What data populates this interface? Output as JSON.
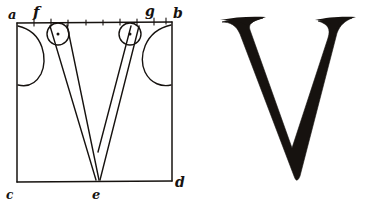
{
  "plate": {
    "title": "Geometric construction of the capital letter V",
    "ink_color": "#16120f",
    "paper_color": "#ffffff"
  },
  "construction": {
    "caption": "Square frame with construction arcs for the letter V",
    "frame": {
      "name": "bounding-square",
      "corner_labels": {
        "top_left": "a",
        "top_right": "b",
        "bottom_left": "c",
        "bottom_right": "d"
      }
    },
    "points": [
      {
        "id": "a",
        "label": "a",
        "role": "top-left-corner"
      },
      {
        "id": "f",
        "label": "f",
        "role": "top-left-stem-start"
      },
      {
        "id": "g",
        "label": "g",
        "role": "top-right-stem-start"
      },
      {
        "id": "b",
        "label": "b",
        "role": "top-right-corner"
      },
      {
        "id": "c",
        "label": "c",
        "role": "bottom-left-corner"
      },
      {
        "id": "e",
        "label": "e",
        "role": "apex-on-baseline"
      },
      {
        "id": "d",
        "label": "d",
        "role": "bottom-right-corner"
      }
    ],
    "elements": [
      {
        "name": "serif-arc-left",
        "type": "arc"
      },
      {
        "name": "serif-arc-right",
        "type": "arc"
      },
      {
        "name": "serif-circle-f",
        "type": "circle-with-center-dot"
      },
      {
        "name": "serif-circle-g",
        "type": "circle-with-center-dot"
      },
      {
        "name": "thick-stroke-outline",
        "type": "polyline"
      },
      {
        "name": "thin-stroke-outline",
        "type": "polyline"
      },
      {
        "name": "top-edge-tick-marks",
        "type": "ticks",
        "count": 9
      }
    ]
  },
  "specimen": {
    "caption": "Finished letter V",
    "glyph": "V"
  }
}
